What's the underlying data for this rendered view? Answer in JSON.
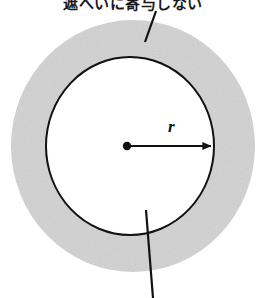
{
  "figure": {
    "title_top": "遮へいに寄与しない",
    "radius_label": "r",
    "width": 266,
    "height": 298,
    "background_color": "#ffffff"
  },
  "shapes": {
    "outer_ring": {
      "name": "shielding-annulus",
      "fill_color": "#d2d2d2",
      "center_x": 133,
      "center_y": 146,
      "radius_x": 122,
      "radius_y": 126
    },
    "inner_circle": {
      "name": "inner-circle",
      "fill_color": "#ffffff",
      "stroke_color": "#111111",
      "stroke_width": 2,
      "center_x": 130,
      "center_y": 146,
      "radius_x": 84,
      "radius_y": 89
    },
    "center_dot": {
      "name": "center-point",
      "color": "#111111",
      "x": 127,
      "y": 146,
      "radius": 4
    },
    "radius_arrow": {
      "name": "radius-arrow",
      "color": "#111111",
      "from_x": 127,
      "from_y": 146,
      "to_x": 214,
      "to_y": 146
    },
    "leader_top": {
      "name": "leader-line-top",
      "color": "#111111",
      "x1": 156,
      "y1": 11,
      "x2": 145,
      "y2": 42
    },
    "leader_bottom": {
      "name": "leader-line-bottom",
      "color": "#111111",
      "x1": 146,
      "y1": 210,
      "x2": 153,
      "y2": 298
    }
  }
}
